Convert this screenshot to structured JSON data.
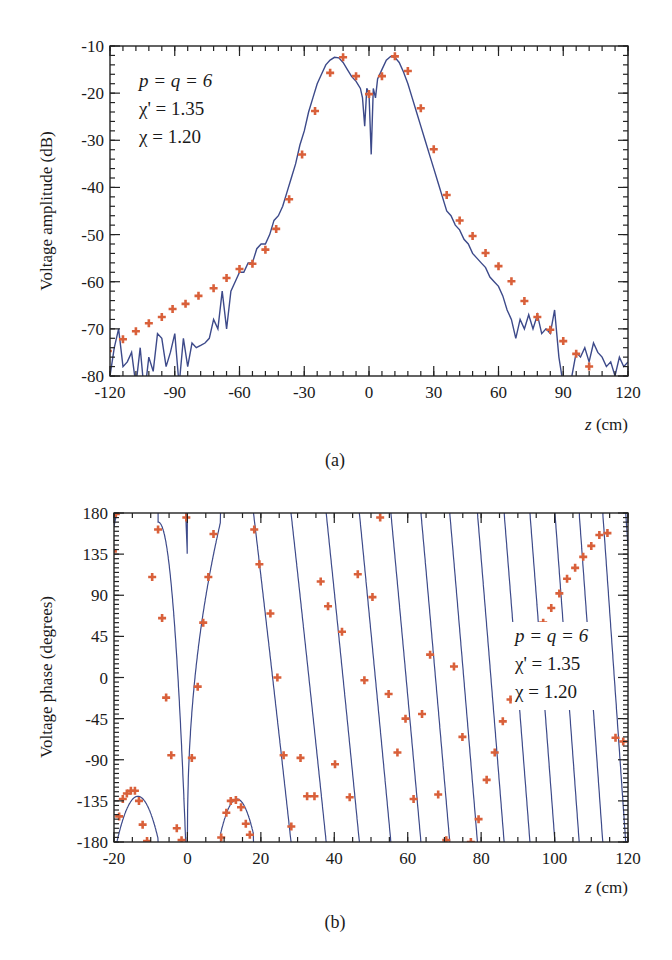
{
  "chart_data": [
    {
      "type": "line",
      "panel_label": "(a)",
      "title": "",
      "xlabel": "z (cm)",
      "xlabel_var": "z",
      "xlabel_unit": " (cm)",
      "ylabel": "Voltage amplitude (dB)",
      "xlim": [
        -120,
        120
      ],
      "ylim": [
        -80,
        -10
      ],
      "xticks": [
        -120,
        -90,
        -60,
        -30,
        0,
        30,
        60,
        90,
        120
      ],
      "yticks": [
        -10,
        -20,
        -30,
        -40,
        -50,
        -60,
        -70,
        -80
      ],
      "grid": false,
      "legend": {
        "position": "upper-left",
        "lines": [
          "p = q = 6",
          "χ' = 1.35",
          "χ = 1.20"
        ]
      },
      "series": [
        {
          "name": "measured",
          "style": "line",
          "color": "#3d4a8a",
          "x": [
            -120,
            -118,
            -116,
            -114,
            -112,
            -110,
            -108,
            -106,
            -104,
            -102,
            -100,
            -98,
            -96,
            -94,
            -92,
            -90,
            -88,
            -86,
            -84,
            -82,
            -80,
            -78,
            -76,
            -74,
            -72,
            -70,
            -68,
            -66,
            -64,
            -62,
            -60,
            -58,
            -56,
            -54,
            -52,
            -50,
            -48,
            -46,
            -44,
            -42,
            -40,
            -38,
            -36,
            -34,
            -32,
            -30,
            -28,
            -26,
            -24,
            -22,
            -20,
            -18,
            -16,
            -14,
            -12,
            -10,
            -8,
            -6,
            -4,
            -3,
            -2,
            -1,
            0,
            1,
            2,
            3,
            4,
            6,
            8,
            10,
            12,
            14,
            16,
            18,
            20,
            22,
            24,
            26,
            28,
            30,
            32,
            34,
            36,
            38,
            40,
            42,
            44,
            46,
            48,
            50,
            52,
            54,
            56,
            58,
            60,
            62,
            64,
            66,
            68,
            70,
            72,
            74,
            76,
            78,
            80,
            82,
            84,
            86,
            88,
            90,
            92,
            94,
            96,
            98,
            100,
            102,
            104,
            106,
            108,
            110,
            112,
            114,
            116,
            118,
            120
          ],
          "y": [
            -80,
            -74,
            -70,
            -78,
            -77,
            -75,
            -82,
            -74,
            -84,
            -76,
            -79,
            -71,
            -72,
            -78,
            -75,
            -71,
            -82,
            -72,
            -78,
            -73,
            -74,
            -73.5,
            -73,
            -72,
            -68,
            -70,
            -62,
            -70,
            -62,
            -60,
            -58,
            -58,
            -56,
            -56,
            -53,
            -52,
            -52,
            -50,
            -47,
            -46,
            -44,
            -41,
            -38,
            -35,
            -31,
            -28,
            -24,
            -21,
            -18,
            -16,
            -14,
            -13,
            -12.4,
            -12.5,
            -13.5,
            -15,
            -16.5,
            -17.5,
            -19,
            -21,
            -27,
            -19,
            -20,
            -33,
            -19,
            -21,
            -17,
            -15,
            -13,
            -12.2,
            -12.4,
            -13.5,
            -15.5,
            -18,
            -21,
            -24,
            -27,
            -30,
            -33,
            -36,
            -39,
            -42,
            -45,
            -46,
            -48,
            -49,
            -51,
            -52,
            -54,
            -55,
            -56,
            -57,
            -59,
            -60,
            -61,
            -63,
            -66,
            -68,
            -72,
            -68,
            -70,
            -67,
            -70,
            -67,
            -71,
            -70,
            -71,
            -66,
            -76,
            -82,
            -84,
            -80,
            -75,
            -76,
            -74,
            -77,
            -73,
            -75,
            -76,
            -78,
            -77,
            -80,
            -76,
            -78,
            -77
          ]
        },
        {
          "name": "simulated",
          "style": "markers",
          "marker": "plus",
          "color": "#d9603a",
          "x": [
            -121,
            -114,
            -108,
            -102,
            -96,
            -91,
            -85,
            -79,
            -72,
            -66,
            -60,
            -54,
            -48,
            -43,
            -37,
            -31,
            -25,
            -18,
            -12,
            -6,
            0,
            6,
            12,
            18,
            24,
            30,
            36,
            42,
            48,
            54,
            60,
            66,
            72,
            78,
            84,
            90,
            96,
            102
          ],
          "y": [
            -74.7,
            -72.2,
            -70.5,
            -68.8,
            -67.5,
            -65.8,
            -64.7,
            -63.0,
            -61.4,
            -59.2,
            -57.3,
            -56.2,
            -53.2,
            -48.8,
            -42.5,
            -33.0,
            -23.8,
            -15.7,
            -12.4,
            -16.4,
            -20.2,
            -16.4,
            -12.2,
            -15.3,
            -23.2,
            -31.9,
            -41.6,
            -47.0,
            -50.3,
            -53.9,
            -56.7,
            -59.9,
            -64.1,
            -67.5,
            -70.2,
            -72.6,
            -75.3,
            -78.0
          ]
        }
      ]
    },
    {
      "type": "line",
      "panel_label": "(b)",
      "title": "",
      "xlabel": "z (cm)",
      "xlabel_var": "z",
      "xlabel_unit": " (cm)",
      "ylabel": "Voltage phase (degrees)",
      "xlim": [
        -20,
        120
      ],
      "ylim": [
        -180,
        180
      ],
      "xticks": [
        -20,
        0,
        20,
        40,
        60,
        80,
        100,
        120
      ],
      "yticks": [
        180,
        135,
        90,
        45,
        0,
        -45,
        -90,
        -135,
        -180
      ],
      "grid": false,
      "legend": {
        "position": "center-right",
        "lines": [
          "p = q = 6",
          "χ' = 1.35",
          "χ = 1.20"
        ]
      },
      "series": [
        {
          "name": "measured",
          "style": "line (wrapped sawtooth, increasing frequency with z)",
          "color": "#3d4a8a",
          "x": [],
          "y": []
        },
        {
          "name": "simulated",
          "style": "markers",
          "marker": "plus",
          "color": "#d9603a",
          "x": [
            -20.3,
            -19.5,
            -18.6,
            -17.6,
            -16.5,
            -15.4,
            -14.3,
            -13.2,
            -12.2,
            -11.0,
            -9.6,
            -8.0,
            -6.9,
            -5.8,
            -4.4,
            -2.9,
            -1.6,
            -0.3,
            1.2,
            2.8,
            4.3,
            5.7,
            7.1,
            9.2,
            10.6,
            11.8,
            13.2,
            14.6,
            15.9,
            17.0,
            18.2,
            19.6,
            22.6,
            24.5,
            26.2,
            28.3,
            30.8,
            32.6,
            34.6,
            36.3,
            38.3,
            40.2,
            42.1,
            44.2,
            46.4,
            48.2,
            50.4,
            52.5,
            54.8,
            57.2,
            59.4,
            61.6,
            63.9,
            66.1,
            68.3,
            70.5,
            72.6,
            74.9,
            77.2,
            79.3,
            81.5,
            83.7,
            85.9,
            88.0,
            90.3,
            92.5,
            94.7,
            96.9,
            99.1,
            101.3,
            103.4,
            105.6,
            107.8,
            110.0,
            112.2,
            114.4,
            116.6,
            118.7
          ],
          "y": [
            138,
            179,
            -152,
            -133,
            -127,
            -124,
            -124,
            -135,
            -161,
            -179,
            110,
            162,
            65,
            -22,
            -85,
            -165,
            -178,
            175,
            -88,
            -10,
            60,
            110,
            157,
            -175,
            -148,
            -135,
            -134,
            -142,
            -160,
            -172,
            162,
            124,
            70,
            0,
            -85,
            -163,
            -88,
            -130,
            -130,
            105,
            78,
            -95,
            50,
            -131,
            113,
            -3,
            88,
            175,
            -18,
            -82,
            -45,
            -133,
            -40,
            25,
            -128,
            -178,
            12,
            -65,
            -180,
            -155,
            -112,
            -82,
            -48,
            -24,
            2,
            24,
            42,
            60,
            76,
            92,
            108,
            120,
            132,
            144,
            156,
            158,
            -66,
            -70
          ]
        }
      ]
    }
  ],
  "figure": {
    "panel_a_label": "(a)",
    "panel_b_label": "(b)"
  }
}
